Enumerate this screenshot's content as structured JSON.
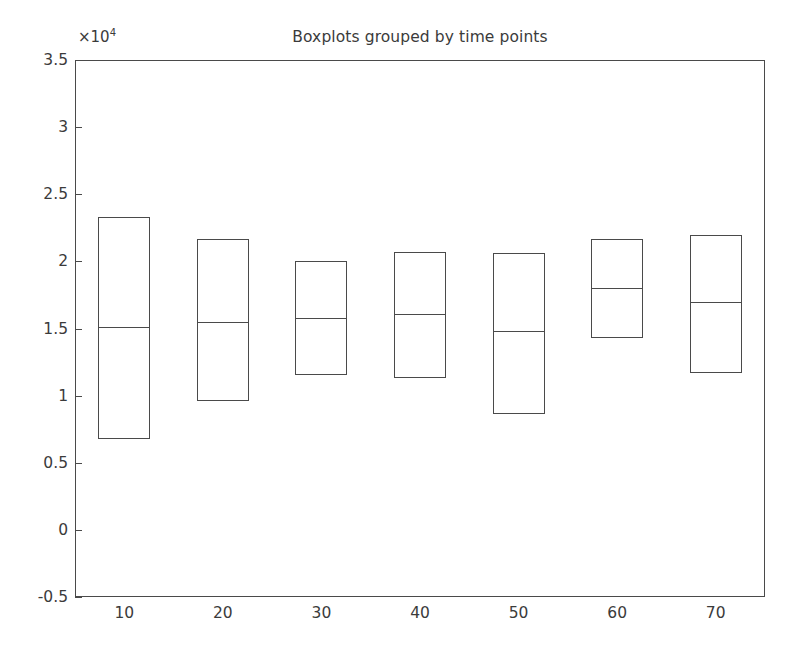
{
  "chart_data": {
    "type": "box",
    "title": "Boxplots grouped by time points",
    "xlabel": "",
    "ylabel": "",
    "y_exponent_prefix": "×10",
    "y_exponent_power": "4",
    "y_exponent_label": "×10⁴",
    "categories": [
      "10",
      "20",
      "30",
      "40",
      "50",
      "60",
      "70"
    ],
    "ylim": [
      -5000,
      35000
    ],
    "xlim": [
      5,
      75
    ],
    "y_ticks": [
      35000,
      30000,
      25000,
      20000,
      15000,
      10000,
      5000,
      0,
      -5000
    ],
    "y_tick_labels": [
      "3.5",
      "3",
      "2.5",
      "2",
      "1.5",
      "1",
      "0.5",
      "0",
      "-0.5"
    ],
    "grid": false,
    "legend": false,
    "whiskers_visible": false,
    "outliers_visible": false,
    "boxes": [
      {
        "category": "10",
        "top": 23300,
        "median": 15100,
        "bottom": 6800
      },
      {
        "category": "20",
        "top": 21700,
        "median": 15500,
        "bottom": 9600
      },
      {
        "category": "30",
        "top": 20000,
        "median": 15800,
        "bottom": 11500
      },
      {
        "category": "40",
        "top": 20700,
        "median": 16100,
        "bottom": 11300
      },
      {
        "category": "50",
        "top": 20600,
        "median": 14800,
        "bottom": 8600
      },
      {
        "category": "60",
        "top": 21700,
        "median": 18000,
        "bottom": 14300
      },
      {
        "category": "70",
        "top": 22000,
        "median": 17000,
        "bottom": 11700
      }
    ],
    "series": [
      {
        "name": "q3",
        "values": [
          23300,
          21700,
          20000,
          20700,
          20600,
          21700,
          22000
        ]
      },
      {
        "name": "median",
        "values": [
          15100,
          15500,
          15800,
          16100,
          14800,
          18000,
          17000
        ]
      },
      {
        "name": "q1",
        "values": [
          6800,
          9600,
          11500,
          11300,
          8600,
          14300,
          11700
        ]
      }
    ],
    "colors": {
      "axis": "#4a4a4a",
      "box_edge": "#4a4a4a",
      "box_fill": "transparent",
      "median": "#4a4a4a",
      "background": "#ffffff",
      "text": "#3b3b3b"
    }
  }
}
